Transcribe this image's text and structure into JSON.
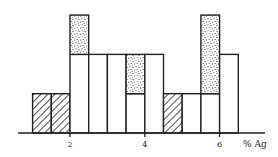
{
  "chart_data": {
    "type": "bar",
    "title": "",
    "xlabel": "% Ag",
    "ylabel": "",
    "xlim": [
      0.6,
      7.0
    ],
    "ylim": [
      0,
      3.4
    ],
    "grid": false,
    "legend": "none",
    "bin_width": 0.5,
    "x_ticks": [
      {
        "value": 2,
        "label": "2"
      },
      {
        "value": 4,
        "label": "4"
      },
      {
        "value": 6,
        "label": "6"
      }
    ],
    "bins": [
      {
        "x0": 1.0,
        "x1": 1.5,
        "segments": [
          {
            "pattern": "hatched",
            "count": 1
          }
        ]
      },
      {
        "x0": 1.5,
        "x1": 2.0,
        "segments": [
          {
            "pattern": "hatched",
            "count": 1
          }
        ]
      },
      {
        "x0": 2.0,
        "x1": 2.5,
        "segments": [
          {
            "pattern": "open",
            "count": 2
          },
          {
            "pattern": "stippled",
            "count": 1
          }
        ]
      },
      {
        "x0": 2.5,
        "x1": 3.0,
        "segments": [
          {
            "pattern": "open",
            "count": 2
          }
        ]
      },
      {
        "x0": 3.0,
        "x1": 3.5,
        "segments": [
          {
            "pattern": "open",
            "count": 2
          }
        ]
      },
      {
        "x0": 3.5,
        "x1": 4.0,
        "segments": [
          {
            "pattern": "open",
            "count": 1
          },
          {
            "pattern": "stippled",
            "count": 1
          }
        ]
      },
      {
        "x0": 4.0,
        "x1": 4.5,
        "segments": [
          {
            "pattern": "open",
            "count": 2
          }
        ]
      },
      {
        "x0": 4.5,
        "x1": 5.0,
        "segments": [
          {
            "pattern": "hatched",
            "count": 1
          }
        ]
      },
      {
        "x0": 5.0,
        "x1": 5.5,
        "segments": [
          {
            "pattern": "open",
            "count": 1
          }
        ]
      },
      {
        "x0": 5.5,
        "x1": 6.0,
        "segments": [
          {
            "pattern": "open",
            "count": 1
          },
          {
            "pattern": "stippled",
            "count": 2
          }
        ]
      },
      {
        "x0": 6.0,
        "x1": 6.5,
        "segments": [
          {
            "pattern": "open",
            "count": 2
          }
        ]
      }
    ],
    "colors": {
      "line": "#222222",
      "background": "#ffffff"
    }
  }
}
